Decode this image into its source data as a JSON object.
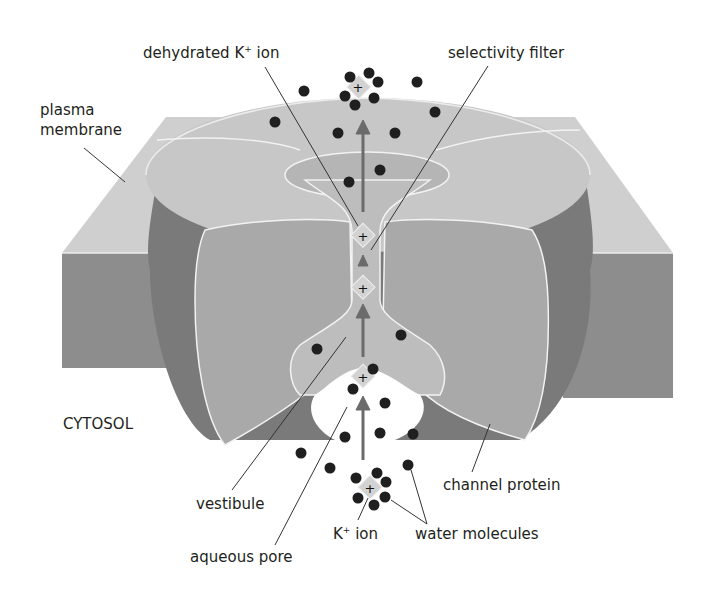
{
  "figure": {
    "colors": {
      "background": "#ffffff",
      "membrane_top": "#cfcfcf",
      "membrane_side": "#8d8d8d",
      "channel_top": "#c7c7c7",
      "channel_rim": "#7a7a7a",
      "channel_cut_face": "#a9a9a9",
      "pore_interior": "#bdbdbd",
      "outline": "#f2f2f2",
      "water_molecule": "#1f1f1f",
      "ion_diamond": "#d2d2d2",
      "arrow": "#6b6b6b",
      "leader_line": "#333333",
      "text": "#231f20"
    }
  },
  "labels": {
    "plasma_membrane_line1": "plasma",
    "plasma_membrane_line2": "membrane",
    "dehydrated_ion_pre": "dehydrated K",
    "dehydrated_ion_sup": "+",
    "dehydrated_ion_post": " ion",
    "selectivity_filter": "selectivity filter",
    "cytosol": "CYTOSOL",
    "vestibule": "vestibule",
    "aqueous_pore": "aqueous pore",
    "k_ion_pre": "K",
    "k_ion_sup": "+",
    "k_ion_post": " ion",
    "water_molecules": "water molecules",
    "channel_protein": "channel protein"
  },
  "ions": [
    {
      "name": "hydrated-ion-top",
      "x": 358,
      "y": 88,
      "hydrated": true
    },
    {
      "name": "dehydrated-ion-filter-upper",
      "x": 363,
      "y": 236,
      "hydrated": false
    },
    {
      "name": "dehydrated-ion-filter-lower",
      "x": 363,
      "y": 288,
      "hydrated": false
    },
    {
      "name": "ion-entering-vestibule",
      "x": 363,
      "y": 377,
      "hydrated": false
    },
    {
      "name": "hydrated-ion-bottom",
      "x": 370,
      "y": 488,
      "hydrated": true
    }
  ]
}
